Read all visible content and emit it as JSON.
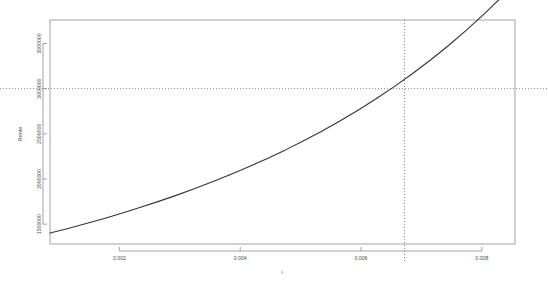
{
  "chart_data": {
    "type": "line",
    "title": "",
    "xlabel": "i",
    "ylabel": "Rente",
    "xlim": [
      0.00085,
      0.00855
    ],
    "ylim": [
      1280000,
      3760000
    ],
    "grid": false,
    "legend": null,
    "x_ticks": [
      {
        "value": 0.002,
        "label": "0.002"
      },
      {
        "value": 0.004,
        "label": "0.004"
      },
      {
        "value": 0.006,
        "label": "0.006"
      },
      {
        "value": 0.008,
        "label": "0.008"
      }
    ],
    "y_ticks": [
      {
        "value": 1500000,
        "label": "1500000"
      },
      {
        "value": 2000000,
        "label": "2000000"
      },
      {
        "value": 2500000,
        "label": "2500000"
      },
      {
        "value": 3000000,
        "label": "3000000"
      },
      {
        "value": 3500000,
        "label": "3500000"
      }
    ],
    "series": [
      {
        "name": "Rente",
        "color": "#333333",
        "x": [
          0.00085,
          0.00115,
          0.00145,
          0.00175,
          0.00205,
          0.00235,
          0.00265,
          0.00295,
          0.00325,
          0.00355,
          0.00385,
          0.00415,
          0.00445,
          0.00475,
          0.00505,
          0.00535,
          0.00565,
          0.00595,
          0.00625,
          0.00655,
          0.00685,
          0.00715,
          0.00745,
          0.00775,
          0.00805,
          0.00835,
          0.00855
        ],
        "y": [
          1401000,
          1452000,
          1506000,
          1563000,
          1623000,
          1686000,
          1752000,
          1821000,
          1894000,
          1971000,
          2052000,
          2137000,
          2227000,
          2322000,
          2423000,
          2529000,
          2642000,
          2761000,
          2888000,
          3022000,
          3165000,
          3317000,
          3478000,
          3650000,
          3833000,
          4028000,
          4138000
        ]
      }
    ],
    "reference_lines": [
      {
        "orientation": "vertical",
        "name": "vertical-reference-line",
        "value": 0.00672,
        "style": "dotted",
        "color": "#555555"
      },
      {
        "orientation": "horizontal",
        "name": "horizontal-reference-line",
        "value": 3000000,
        "style": "dotted",
        "color": "#555555"
      }
    ],
    "box": {
      "border": true,
      "color": "#8c8c8c"
    }
  }
}
